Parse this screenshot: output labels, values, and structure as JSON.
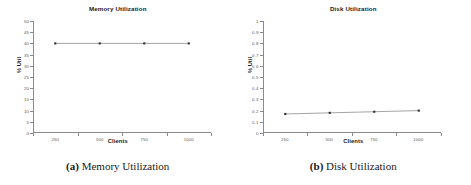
{
  "figure": {
    "panels": [
      {
        "key": "memory",
        "caption_label": "(a)",
        "caption_text": "Memory Utilization"
      },
      {
        "key": "disk",
        "caption_label": "(b)",
        "caption_text": "Disk Utilization"
      }
    ]
  },
  "chart_data": [
    {
      "type": "line",
      "title": "Memory Utilization",
      "xlabel": "Clients",
      "ylabel": "% Util",
      "categories": [
        "250",
        "500",
        "750",
        "1000"
      ],
      "x": [
        250,
        500,
        750,
        1000
      ],
      "values": [
        40,
        40,
        40,
        40
      ],
      "series": [
        {
          "name": "Memory Utilization",
          "values": [
            40,
            40,
            40,
            40
          ]
        }
      ],
      "ylim": [
        0,
        50
      ],
      "ytick_labels": [
        "0",
        "5",
        "10",
        "15",
        "20",
        "25",
        "30",
        "35",
        "40",
        "45",
        "50"
      ],
      "ytick_values": [
        0,
        5,
        10,
        15,
        20,
        25,
        30,
        35,
        40,
        45,
        50
      ],
      "xtick_labels": [
        "250",
        "500",
        "750",
        "1000"
      ],
      "grid": false,
      "legend": false,
      "marker": "square",
      "line_color": "#9a9a9a",
      "marker_color": "#2b2b2b",
      "axis_color": "#8a8a8a"
    },
    {
      "type": "line",
      "title": "Disk Utilization",
      "xlabel": "Clients",
      "ylabel": "% Util",
      "categories": [
        "250",
        "500",
        "750",
        "1000"
      ],
      "x": [
        250,
        500,
        750,
        1000
      ],
      "values": [
        0.17,
        0.18,
        0.19,
        0.2
      ],
      "series": [
        {
          "name": "Disk Utilization",
          "values": [
            0.17,
            0.18,
            0.19,
            0.2
          ]
        }
      ],
      "ylim": [
        0,
        1
      ],
      "ytick_labels": [
        "0",
        "0.1",
        "0.2",
        "0.3",
        "0.4",
        "0.5",
        "0.6",
        "0.7",
        "0.8",
        "0.9",
        "1"
      ],
      "ytick_values": [
        0,
        0.1,
        0.2,
        0.3,
        0.4,
        0.5,
        0.6,
        0.7,
        0.8,
        0.9,
        1
      ],
      "xtick_labels": [
        "250",
        "500",
        "750",
        "1000"
      ],
      "grid": false,
      "legend": false,
      "marker": "square",
      "line_color": "#9a9a9a",
      "marker_color": "#2b2b2b",
      "axis_color": "#8a8a8a"
    }
  ]
}
